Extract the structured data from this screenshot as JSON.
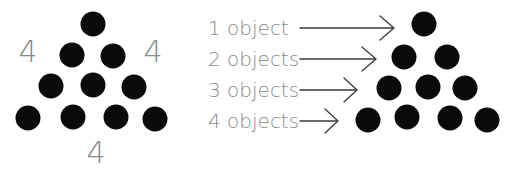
{
  "left_triangle": {
    "side_labels": [
      "4",
      "4",
      "4"
    ],
    "rows": [
      1,
      2,
      3,
      4
    ],
    "total_dots": 10
  },
  "labels": [
    {
      "text": "1 object"
    },
    {
      "text": "2 objects"
    },
    {
      "text": "3 objects"
    },
    {
      "text": "4 objects"
    }
  ],
  "colors": {
    "dot": "#0a0a0a",
    "text": "#8a8a8a",
    "arrow": "#3a3a3a"
  }
}
